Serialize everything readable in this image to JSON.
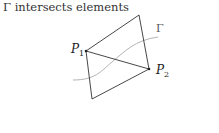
{
  "title": "Γ intersects elements",
  "diagram": {
    "curve_label": "Γ",
    "points": [
      {
        "name": "P",
        "sub": "1"
      },
      {
        "name": "P",
        "sub": "2"
      }
    ],
    "colors": {
      "edges": "#333333",
      "curve": "#aaaaaa"
    }
  }
}
